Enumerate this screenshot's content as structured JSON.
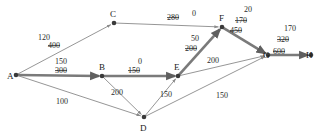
{
  "diagram": {
    "colors": {
      "edge_thin": "#8a8a8a",
      "edge_bold": "#7a7a7a",
      "node": "#3a3a3a",
      "text": "#1a1a1a",
      "background": "#ffffff"
    },
    "nodes": [
      {
        "id": "A",
        "label": "A",
        "x": 16,
        "y": 75,
        "label_x": 7,
        "label_y": 79
      },
      {
        "id": "B",
        "label": "B",
        "x": 102,
        "y": 76,
        "label_x": 99,
        "label_y": 70
      },
      {
        "id": "C",
        "label": "C",
        "x": 114,
        "y": 23,
        "label_x": 110,
        "label_y": 17
      },
      {
        "id": "D",
        "label": "D",
        "x": 144,
        "y": 117,
        "label_x": 140,
        "label_y": 131
      },
      {
        "id": "E",
        "label": "E",
        "x": 178,
        "y": 76,
        "label_x": 174,
        "label_y": 70
      },
      {
        "id": "F",
        "label": "F",
        "x": 222,
        "y": 27,
        "label_x": 219,
        "label_y": 21
      },
      {
        "id": "G",
        "label": "G",
        "x": 268,
        "y": 55,
        "label_x": 263,
        "label_y": 58
      },
      {
        "id": "H",
        "label": "H",
        "x": 311,
        "y": 55,
        "label_x": 306,
        "label_y": 58
      }
    ],
    "edges": [
      {
        "id": "A-C",
        "from": "A",
        "to": "C",
        "style": "thin",
        "labels": [
          {
            "text": "120",
            "x": 44,
            "y": 40,
            "struck": false
          },
          {
            "text": "400",
            "x": 54,
            "y": 48,
            "struck": true
          }
        ]
      },
      {
        "id": "A-B",
        "from": "A",
        "to": "B",
        "style": "bold",
        "labels": [
          {
            "text": "150",
            "x": 61,
            "y": 64,
            "struck": false
          },
          {
            "text": "300",
            "x": 61,
            "y": 73,
            "struck": true
          }
        ]
      },
      {
        "id": "A-D",
        "from": "A",
        "to": "D",
        "style": "thin",
        "labels": [
          {
            "text": "100",
            "x": 62,
            "y": 104,
            "struck": false
          }
        ]
      },
      {
        "id": "C-F",
        "from": "C",
        "to": "F",
        "style": "thin",
        "labels": [
          {
            "text": "280",
            "x": 173,
            "y": 20,
            "struck": true
          },
          {
            "text": "0",
            "x": 194,
            "y": 16,
            "struck": false
          }
        ]
      },
      {
        "id": "B-E",
        "from": "B",
        "to": "E",
        "style": "bold",
        "labels": [
          {
            "text": "0",
            "x": 140,
            "y": 64,
            "struck": false
          },
          {
            "text": "150",
            "x": 134,
            "y": 73,
            "struck": true
          }
        ]
      },
      {
        "id": "B-D",
        "from": "B",
        "to": "D",
        "style": "thin",
        "labels": [
          {
            "text": "200",
            "x": 117,
            "y": 95,
            "struck": false
          }
        ]
      },
      {
        "id": "D-E",
        "from": "D",
        "to": "E",
        "style": "thin",
        "labels": [
          {
            "text": "150",
            "x": 166,
            "y": 97,
            "struck": false
          }
        ]
      },
      {
        "id": "D-G",
        "from": "D",
        "to": "G",
        "style": "thin",
        "labels": [
          {
            "text": "150",
            "x": 222,
            "y": 98,
            "struck": false
          }
        ]
      },
      {
        "id": "E-F",
        "from": "E",
        "to": "F",
        "style": "bold",
        "labels": [
          {
            "text": "50",
            "x": 195,
            "y": 41,
            "struck": false
          },
          {
            "text": "200",
            "x": 191,
            "y": 51,
            "struck": true
          }
        ]
      },
      {
        "id": "E-G",
        "from": "E",
        "to": "G",
        "style": "thin",
        "labels": [
          {
            "text": "200",
            "x": 213,
            "y": 63,
            "struck": false
          }
        ]
      },
      {
        "id": "F-G",
        "from": "F",
        "to": "G",
        "style": "bold",
        "labels": [
          {
            "text": "20",
            "x": 248,
            "y": 12,
            "struck": false
          },
          {
            "text": "170",
            "x": 241,
            "y": 23,
            "struck": true
          },
          {
            "text": "450",
            "x": 236,
            "y": 33,
            "struck": true
          }
        ]
      },
      {
        "id": "G-H",
        "from": "G",
        "to": "H",
        "style": "bold",
        "labels": [
          {
            "text": "170",
            "x": 290,
            "y": 31,
            "struck": false
          },
          {
            "text": "320",
            "x": 283,
            "y": 42,
            "struck": true
          },
          {
            "text": "600",
            "x": 279,
            "y": 54,
            "struck": true
          }
        ]
      }
    ]
  }
}
